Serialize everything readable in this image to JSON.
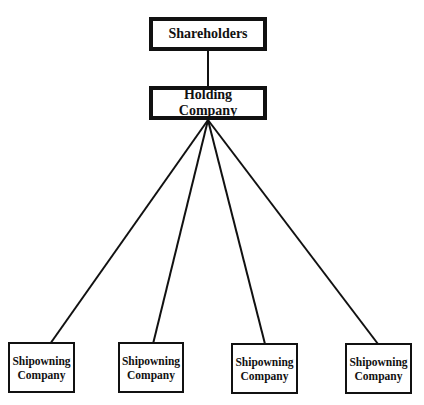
{
  "diagram": {
    "type": "organization-chart",
    "nodes": {
      "shareholders": {
        "label": "Shareholders"
      },
      "holding": {
        "label": "Holding Company"
      },
      "subsidiaries": [
        {
          "line1": "Shipowning",
          "line2": "Company"
        },
        {
          "line1": "Shipowning",
          "line2": "Company"
        },
        {
          "line1": "Shipowning",
          "line2": "Company"
        },
        {
          "line1": "Shipowning",
          "line2": "Company"
        }
      ]
    },
    "edges": [
      [
        "Shareholders",
        "Holding Company"
      ],
      [
        "Holding Company",
        "Shipowning Company 1"
      ],
      [
        "Holding Company",
        "Shipowning Company 2"
      ],
      [
        "Holding Company",
        "Shipowning Company 3"
      ],
      [
        "Holding Company",
        "Shipowning Company 4"
      ]
    ],
    "colors": {
      "line": "#111111",
      "background": "#ffffff"
    }
  }
}
